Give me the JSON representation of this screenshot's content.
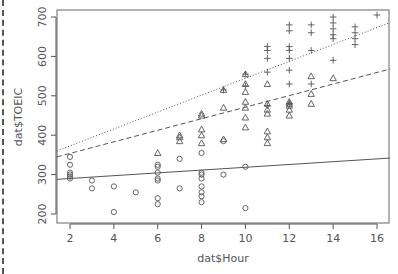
{
  "chart_data": {
    "type": "scatter",
    "title": "",
    "xlabel": "dat$Hour",
    "ylabel": "dat$TOEIC",
    "xlim": [
      1.4,
      16.6
    ],
    "ylim": [
      195,
      720
    ],
    "xticks": [
      2,
      4,
      6,
      8,
      10,
      12,
      14,
      16
    ],
    "yticks": [
      200,
      300,
      400,
      500,
      600,
      700
    ],
    "grid": false,
    "legend": null,
    "series": [
      {
        "name": "group-circle",
        "marker": "circle",
        "points": [
          [
            2,
            345
          ],
          [
            2,
            325
          ],
          [
            2,
            305
          ],
          [
            2,
            300
          ],
          [
            2,
            295
          ],
          [
            2,
            290
          ],
          [
            3,
            285
          ],
          [
            3,
            265
          ],
          [
            4,
            270
          ],
          [
            4,
            205
          ],
          [
            5,
            255
          ],
          [
            6,
            325
          ],
          [
            6,
            320
          ],
          [
            6,
            305
          ],
          [
            6,
            290
          ],
          [
            6,
            285
          ],
          [
            6,
            240
          ],
          [
            6,
            225
          ],
          [
            7,
            340
          ],
          [
            7,
            265
          ],
          [
            8,
            355
          ],
          [
            8,
            305
          ],
          [
            8,
            300
          ],
          [
            8,
            290
          ],
          [
            8,
            270
          ],
          [
            8,
            255
          ],
          [
            8,
            245
          ],
          [
            8,
            230
          ],
          [
            9,
            385
          ],
          [
            9,
            300
          ],
          [
            10,
            320
          ],
          [
            10,
            215
          ]
        ]
      },
      {
        "name": "group-triangle",
        "marker": "triangle",
        "points": [
          [
            6,
            355
          ],
          [
            7,
            400
          ],
          [
            7,
            395
          ],
          [
            7,
            385
          ],
          [
            8,
            455
          ],
          [
            8,
            450
          ],
          [
            8,
            415
          ],
          [
            8,
            400
          ],
          [
            8,
            380
          ],
          [
            9,
            390
          ],
          [
            9,
            470
          ],
          [
            9,
            515
          ],
          [
            10,
            555
          ],
          [
            10,
            530
          ],
          [
            10,
            510
          ],
          [
            10,
            485
          ],
          [
            10,
            470
          ],
          [
            10,
            445
          ],
          [
            10,
            420
          ],
          [
            11,
            530
          ],
          [
            11,
            480
          ],
          [
            11,
            465
          ],
          [
            11,
            455
          ],
          [
            11,
            410
          ],
          [
            11,
            395
          ],
          [
            11,
            380
          ],
          [
            12,
            485
          ],
          [
            12,
            480
          ],
          [
            12,
            475
          ],
          [
            12,
            465
          ],
          [
            12,
            450
          ],
          [
            13,
            550
          ],
          [
            13,
            505
          ],
          [
            13,
            480
          ],
          [
            14,
            545
          ]
        ]
      },
      {
        "name": "group-plus",
        "marker": "plus",
        "points": [
          [
            9,
            515
          ],
          [
            10,
            555
          ],
          [
            10,
            525
          ],
          [
            11,
            625
          ],
          [
            11,
            615
          ],
          [
            11,
            595
          ],
          [
            11,
            560
          ],
          [
            11,
            475
          ],
          [
            12,
            680
          ],
          [
            12,
            665
          ],
          [
            12,
            625
          ],
          [
            12,
            615
          ],
          [
            12,
            595
          ],
          [
            12,
            565
          ],
          [
            12,
            530
          ],
          [
            12,
            480
          ],
          [
            13,
            680
          ],
          [
            13,
            660
          ],
          [
            13,
            615
          ],
          [
            13,
            530
          ],
          [
            14,
            700
          ],
          [
            14,
            685
          ],
          [
            14,
            670
          ],
          [
            14,
            655
          ],
          [
            14,
            645
          ],
          [
            14,
            590
          ],
          [
            15,
            675
          ],
          [
            15,
            660
          ],
          [
            15,
            645
          ],
          [
            15,
            630
          ],
          [
            16,
            705
          ]
        ]
      }
    ],
    "lines": [
      {
        "name": "fit-solid",
        "style": "solid",
        "x": [
          1.4,
          16.6
        ],
        "y": [
          288,
          342
        ]
      },
      {
        "name": "fit-dashed",
        "style": "dashed",
        "x": [
          1.4,
          16.6
        ],
        "y": [
          345,
          568
        ]
      },
      {
        "name": "fit-dotted",
        "style": "dotted",
        "x": [
          1.4,
          16.6
        ],
        "y": [
          360,
          686
        ]
      }
    ]
  }
}
